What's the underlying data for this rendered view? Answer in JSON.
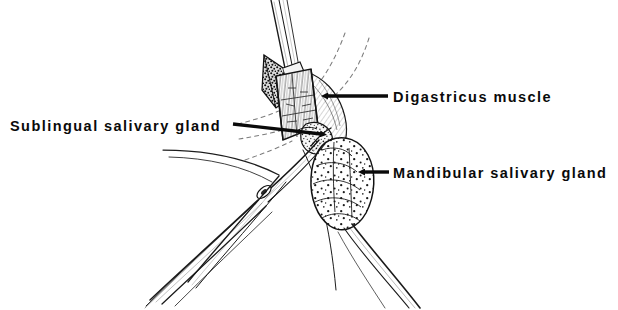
{
  "figure": {
    "kind": "anatomical-line-drawing",
    "background_color": "#ffffff",
    "ink_color": "#111111",
    "width": 618,
    "height": 310
  },
  "labels": [
    {
      "id": "sublingual",
      "text": "Sublingual salivary gland",
      "text_x": 10,
      "text_y": 131,
      "anchor": "start",
      "leader": {
        "x1": 233,
        "y1": 124,
        "x2": 321,
        "y2": 134,
        "head_x": 327,
        "head_y": 136
      }
    },
    {
      "id": "digastricus",
      "text": "Digastricus muscle",
      "text_x": 393,
      "text_y": 102,
      "anchor": "start",
      "leader": {
        "x1": 388,
        "y1": 96,
        "x2": 327,
        "y2": 96,
        "head_x": 319,
        "head_y": 96
      }
    },
    {
      "id": "mandibular",
      "text": "Mandibular salivary gland",
      "text_x": 393,
      "text_y": 178,
      "anchor": "start",
      "leader": {
        "x1": 389,
        "y1": 172,
        "x2": 364,
        "y2": 172,
        "head_x": 355,
        "head_y": 173
      }
    }
  ],
  "structures": {
    "digastricus_muscle": {
      "name": "Digastricus muscle",
      "texture": "fine vertical striations, pale band",
      "fill": "#fbfbfb"
    },
    "mandibular_salivary_gland": {
      "name": "Mandibular salivary gland",
      "texture": "coarse lobular stipple",
      "fill": "#ffffff"
    },
    "sublingual_salivary_gland": {
      "name": "Sublingual salivary gland",
      "texture": "fine dense stipple",
      "fill": "#f2f2f2"
    },
    "tissue_flap": {
      "name": "Reflected tissue flap",
      "texture": "dark stipple",
      "fill": "#e8e8e8"
    },
    "forceps": {
      "name": "Surgical forceps",
      "detail": "hinged hemostat with box lock, jaws directed upper-right"
    },
    "retractor": {
      "name": "Upper instrument",
      "detail": "slender blade descending from top of field"
    }
  },
  "guides": {
    "dotted_curves": 4,
    "description": "Dashed fascial plane guide lines fanning from the surgical field"
  }
}
